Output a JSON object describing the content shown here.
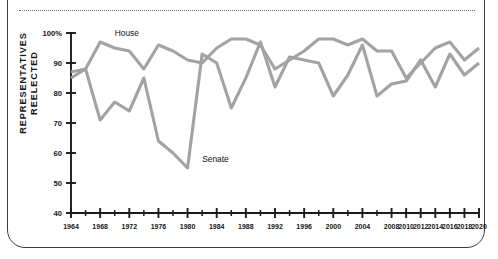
{
  "figure": {
    "yaxis_title_line1": "REPRESENTATIVES",
    "yaxis_title_line2": "REELECTED",
    "house_label": "House",
    "senate_label": "Senate",
    "line_color": "#a3a3a3",
    "axis_color": "#1c1c1c",
    "frame_color": "#3a3a3a"
  },
  "chart_data": {
    "type": "line",
    "title": "",
    "xlabel": "",
    "ylabel": "REPRESENTATIVES REELECTED",
    "ylim": [
      40,
      100
    ],
    "xlim": [
      1964,
      2020
    ],
    "grid": false,
    "legend": "inline-annotations",
    "ytick_labels": [
      "100%",
      "90",
      "80",
      "70",
      "60",
      "50",
      "40"
    ],
    "ytick_values": [
      100,
      90,
      80,
      70,
      60,
      50,
      40
    ],
    "xtick_labels": [
      "1964",
      "1968",
      "1972",
      "1976",
      "1980",
      "1984",
      "1988",
      "1992",
      "1996",
      "2000",
      "2004",
      "2008",
      "2010",
      "2012",
      "2014",
      "2016",
      "2018",
      "2020"
    ],
    "xtick_values": [
      1964,
      1968,
      1972,
      1976,
      1980,
      1984,
      1988,
      1992,
      1996,
      2000,
      2004,
      2008,
      2010,
      2012,
      2014,
      2016,
      2018,
      2020
    ],
    "x": [
      1964,
      1966,
      1968,
      1970,
      1972,
      1974,
      1976,
      1978,
      1980,
      1982,
      1984,
      1986,
      1988,
      1990,
      1992,
      1994,
      1996,
      1998,
      2000,
      2002,
      2004,
      2006,
      2008,
      2010,
      2012,
      2014,
      2016,
      2018,
      2020
    ],
    "series": [
      {
        "name": "House",
        "values": [
          87,
          88,
          97,
          95,
          94,
          88,
          96,
          94,
          91,
          90,
          95,
          98,
          98,
          96,
          88,
          91,
          94,
          98,
          98,
          96,
          98,
          94,
          94,
          85,
          90,
          95,
          97,
          91,
          95
        ]
      },
      {
        "name": "Senate",
        "values": [
          85,
          88,
          71,
          77,
          74,
          85,
          64,
          60,
          55,
          93,
          90,
          75,
          85,
          97,
          82,
          92,
          91,
          90,
          79,
          86,
          96,
          79,
          83,
          84,
          91,
          82,
          93,
          86,
          90
        ]
      }
    ],
    "annotations": [
      {
        "text": "House",
        "x": 1970,
        "y": 99
      },
      {
        "text": "Senate",
        "x": 1982,
        "y": 57
      }
    ]
  }
}
